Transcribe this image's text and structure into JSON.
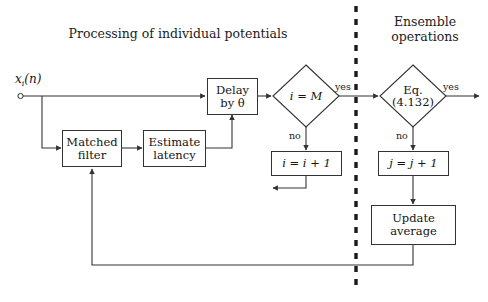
{
  "diagram": {
    "type": "flowchart",
    "sections": {
      "left_title": "Processing of individual potentials",
      "right_title_line1": "Ensemble",
      "right_title_line2": "operations"
    },
    "input": {
      "label": "x",
      "subscript": "i",
      "argument": "(n)",
      "full": "x_i(n)"
    },
    "boxes": [
      {
        "id": "matched-filter",
        "line1": "Matched",
        "line2": "filter"
      },
      {
        "id": "estimate-latency",
        "line1": "Estimate",
        "line2": "latency"
      },
      {
        "id": "delay",
        "line1": "Delay",
        "line2": "by θ"
      },
      {
        "id": "increment-i",
        "line1": "i = i + 1",
        "line2": ""
      },
      {
        "id": "increment-j",
        "line1": "j = j + 1",
        "line2": ""
      },
      {
        "id": "update-average",
        "line1": "Update",
        "line2": "average"
      }
    ],
    "decisions": [
      {
        "id": "i-equals-m",
        "line1": "i = M",
        "line2": "",
        "yes": "yes",
        "no": "no"
      },
      {
        "id": "eq-4132",
        "line1": "Eq.",
        "line2": "(4.132)",
        "yes": "yes",
        "no": "no"
      }
    ],
    "edge_labels": {
      "yes_left": "yes",
      "no_left": "no",
      "yes_right": "yes",
      "no_right": "no"
    },
    "colors": {
      "stroke": "#333333",
      "text": "#141414",
      "background": "#ffffff",
      "divider": "#1a1a1a"
    }
  }
}
